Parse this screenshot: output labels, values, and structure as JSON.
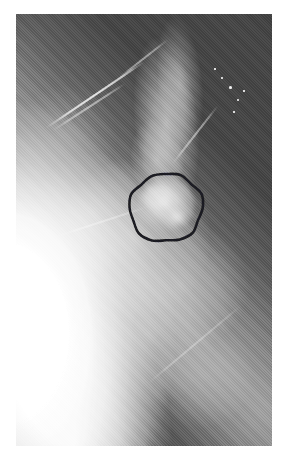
{
  "figure": {
    "kind": "medical-radiograph",
    "modality": "mammogram",
    "caption": "",
    "plate": {
      "x": 16,
      "y": 14,
      "width": 256,
      "height": 432,
      "page_background": "#ffffff",
      "film_base_color": "#3a3a3a",
      "bright_tissue_color": "#ffffff",
      "mid_tissue_color": "#bdbdbd"
    },
    "annotation": {
      "type": "hand-drawn-circle",
      "label": "",
      "stroke_color": "#17171a",
      "stroke_width": 2.6,
      "center_x": 150,
      "center_y": 194,
      "radius_x": 36,
      "radius_y": 34,
      "path": "M 121 47 C 118 36 124 27 134 21 C 144 15 157 12 168 14 C 178 16 186 21 190 29 C 195 38 196 50 194 60 C 192 70 186 77 177 81 C 167 85 155 86 145 83 C 134 80 126 72 122 62 C 120 57 120 52 121 47 Z"
    },
    "lesion": {
      "name": "circumscribed-mass",
      "center_x": 150,
      "center_y": 192,
      "width": 58,
      "height": 54,
      "brightness": "#d8d8d8"
    },
    "specks": [
      {
        "x": 214,
        "y": 73,
        "r": 1.5
      },
      {
        "x": 222,
        "y": 86,
        "r": 1.1
      },
      {
        "x": 206,
        "y": 64,
        "r": 0.9
      },
      {
        "x": 218,
        "y": 98,
        "r": 0.8
      },
      {
        "x": 199,
        "y": 55,
        "r": 0.7
      },
      {
        "x": 228,
        "y": 77,
        "r": 0.7
      }
    ],
    "streaks": [
      {
        "name": "vessel-streak-upper-left"
      },
      {
        "name": "vessel-streak-upper-left-secondary"
      },
      {
        "name": "vessel-streak-top"
      },
      {
        "name": "vessel-streak-right"
      },
      {
        "name": "vessel-streak-lower-left"
      },
      {
        "name": "vessel-streak-bottom"
      }
    ]
  }
}
